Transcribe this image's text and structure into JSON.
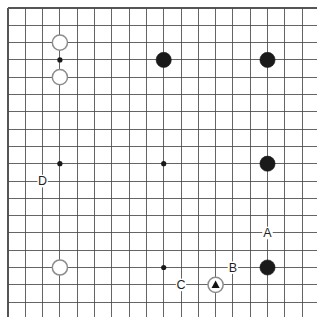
{
  "figure": {
    "kind": "go-board-diagram",
    "caption": "",
    "board": {
      "size": 18,
      "origin_x": 8,
      "origin_y": 8,
      "spacing": 17.3,
      "line_color": "#4a4a4a",
      "edge_color": "#555555",
      "background": "#ffffff",
      "star_radius": 2.6,
      "stone_radius": 7.6
    },
    "star_points": [
      {
        "col": 3,
        "row": 3
      },
      {
        "col": 3,
        "row": 9
      },
      {
        "col": 9,
        "row": 9
      },
      {
        "col": 9,
        "row": 15
      }
    ],
    "stones": [
      {
        "id": "w1",
        "color": "white",
        "col": 3,
        "row": 2,
        "mark": ""
      },
      {
        "id": "w2",
        "color": "white",
        "col": 3,
        "row": 4,
        "mark": ""
      },
      {
        "id": "w3",
        "color": "white",
        "col": 3,
        "row": 15,
        "mark": ""
      },
      {
        "id": "b1",
        "color": "black",
        "col": 9,
        "row": 3,
        "mark": ""
      },
      {
        "id": "b2",
        "color": "black",
        "col": 15,
        "row": 3,
        "mark": ""
      },
      {
        "id": "b3",
        "color": "black",
        "col": 15,
        "row": 9,
        "mark": ""
      },
      {
        "id": "b4",
        "color": "black",
        "col": 15,
        "row": 15,
        "mark": ""
      },
      {
        "id": "w4",
        "color": "white",
        "col": 12,
        "row": 16,
        "mark": "triangle"
      }
    ],
    "labels": [
      {
        "id": "A",
        "text": "A",
        "col": 15,
        "row": 13,
        "dx": 0,
        "dy": 0
      },
      {
        "id": "B",
        "text": "B",
        "col": 13,
        "row": 15,
        "dx": 0,
        "dy": 0
      },
      {
        "id": "C",
        "text": "C",
        "col": 10,
        "row": 16,
        "dx": 0,
        "dy": 0
      },
      {
        "id": "D",
        "text": "D",
        "col": 2,
        "row": 10,
        "dx": 0,
        "dy": 0
      }
    ],
    "colors": {
      "black_stone": "#1a1a1a",
      "white_stone_fill": "#ffffff",
      "white_stone_edge": "#8c8c8c",
      "grid": "#4a4a4a",
      "label_text": "#1f1f1f",
      "marker": "#111111"
    }
  }
}
